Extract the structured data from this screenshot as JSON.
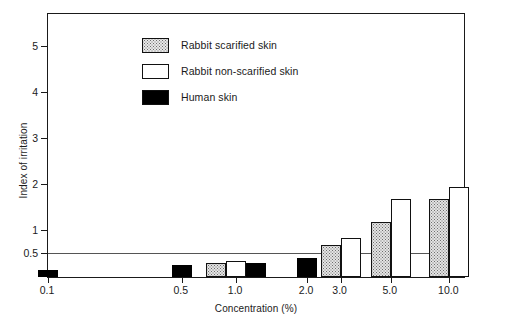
{
  "chart_data": {
    "type": "bar",
    "title": "",
    "xlabel": "Concentration (%)",
    "ylabel": "Index of irritation",
    "categories": [
      "0.1",
      "0.5",
      "1.0",
      "2.0",
      "3.0",
      "5.0",
      "10.0"
    ],
    "series": [
      {
        "name": "Rabbit scarified skin",
        "swatch": "stippled",
        "color": "#e3e3e3",
        "values": [
          null,
          null,
          0.3,
          null,
          0.7,
          1.2,
          1.7
        ]
      },
      {
        "name": "Rabbit non-scarified skin",
        "swatch": "white",
        "color": "#ffffff",
        "values": [
          null,
          null,
          0.35,
          null,
          0.85,
          1.7,
          1.95
        ]
      },
      {
        "name": "Human skin",
        "swatch": "black",
        "color": "#000000",
        "values": [
          0.15,
          0.25,
          0.3,
          0.42,
          null,
          null,
          null
        ]
      }
    ],
    "yticks": [
      "0.5",
      "1",
      "2",
      "3",
      "4",
      "5"
    ],
    "ytick_values": [
      0.5,
      1,
      2,
      3,
      4,
      5
    ],
    "ylim": [
      0,
      5.75
    ],
    "xlim_note": "logarithmic concentration axis",
    "grid": false,
    "reference_line": {
      "value": 0.5,
      "label": "",
      "color": "#555555"
    },
    "legend_position": "top-left inside plot",
    "annotations": []
  },
  "legend": {
    "items": [
      {
        "label": "Rabbit scarified skin"
      },
      {
        "label": "Rabbit non-scarified skin"
      },
      {
        "label": "Human skin"
      }
    ]
  },
  "axes": {
    "y_label": "Index of irritation",
    "x_label": "Concentration (%)",
    "y_ticks": [
      {
        "label": "5",
        "value": 5
      },
      {
        "label": "4",
        "value": 4
      },
      {
        "label": "3",
        "value": 3
      },
      {
        "label": "2",
        "value": 2
      },
      {
        "label": "1",
        "value": 1
      },
      {
        "label": "0.5",
        "value": 0.5
      }
    ],
    "x_ticks": [
      {
        "label": "0.1",
        "pos": 0.0
      },
      {
        "label": "0.5",
        "pos": 0.32
      },
      {
        "label": "1.0",
        "pos": 0.45
      },
      {
        "label": "2.0",
        "pos": 0.62
      },
      {
        "label": "3.0",
        "pos": 0.7
      },
      {
        "label": "5.0",
        "pos": 0.82
      },
      {
        "label": "10.0",
        "pos": 0.96
      }
    ]
  }
}
